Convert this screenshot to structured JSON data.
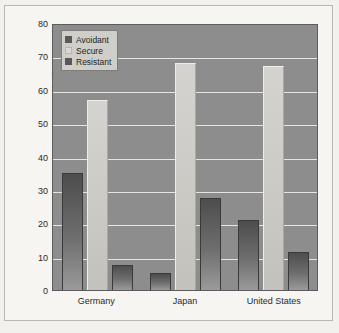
{
  "chart_data": {
    "type": "bar",
    "title": "",
    "xlabel": "",
    "ylabel": "Percentage of Infants",
    "ylim": [
      0,
      80
    ],
    "yticks": [
      80,
      70,
      60,
      50,
      40,
      30,
      20,
      10,
      0
    ],
    "grid": true,
    "legend_position": "top-left",
    "categories": [
      "Germany",
      "Japan",
      "United States"
    ],
    "series": [
      {
        "name": "Avoidant",
        "values": [
          35,
          5,
          21
        ],
        "color": "#595959"
      },
      {
        "name": "Secure",
        "values": [
          57,
          68,
          67
        ],
        "color": "#dad9d5"
      },
      {
        "name": "Resistant",
        "values": [
          7.5,
          27.5,
          11.5
        ],
        "color": "#595959"
      }
    ]
  },
  "axis": {
    "y_title": "Percentage of Infants",
    "y_labels": [
      "80",
      "70",
      "60",
      "50",
      "40",
      "30",
      "20",
      "10",
      "0"
    ],
    "x_labels": [
      "Germany",
      "Japan",
      "United States"
    ]
  },
  "legend": {
    "items": [
      {
        "label": "Avoidant"
      },
      {
        "label": "Secure"
      },
      {
        "label": "Resistant"
      }
    ]
  },
  "colors": {
    "plot_background": "#8d8d8d",
    "gridline": "#e6e5e1",
    "page_background": "#f6f5f2",
    "bar_dark": "#595959",
    "bar_light": "#dad9d5"
  }
}
